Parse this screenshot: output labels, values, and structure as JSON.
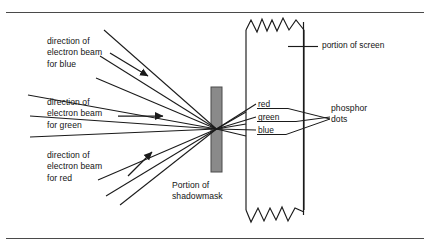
{
  "figure": {
    "background_color": "#ffffff",
    "line_color": "#1a1a1a",
    "shadowmask_fill": "#8a8a8a",
    "shadowmask_stroke": "#4a4a4a",
    "rule_color": "#444444"
  },
  "labels": {
    "beam_blue": "direction of\nelectron beam\nfor blue",
    "beam_green": "direction of\nelectron beam\nfor green",
    "beam_red": "direction of\nelectron beam\nfor red",
    "shadowmask": "Portion of\nshadowmask",
    "screen": "portion of screen",
    "phosphor": "phosphor\ndots"
  },
  "channels": [
    {
      "name": "red",
      "label": "red"
    },
    {
      "name": "green",
      "label": "green"
    },
    {
      "name": "blue",
      "label": "blue"
    }
  ],
  "elements": {
    "shadowmask_aperture": "convergence point",
    "screen_band": "phosphor screen cross-section",
    "torn_edge_top": "zigzag break line",
    "torn_edge_bottom": "zigzag break line"
  }
}
